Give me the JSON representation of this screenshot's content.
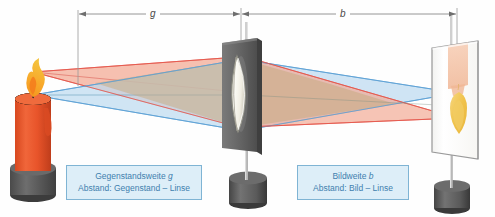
{
  "figure": {
    "background_color": "#fefefe"
  },
  "dimensions": [
    {
      "name": "object-distance",
      "symbol": "g",
      "from_x": 78,
      "to_x": 241,
      "y": 14,
      "label_x": 152,
      "color": "#8a8a8a"
    },
    {
      "name": "image-distance",
      "symbol": "b",
      "from_x": 241,
      "to_x": 457,
      "y": 14,
      "label_x": 342,
      "color": "#8a8a8a"
    }
  ],
  "callouts": [
    {
      "name": "object-distance-callout",
      "line1_prefix": "Gegenstandsweite ",
      "line1_symbol": "g",
      "line2": "Abstand: Gegenstand – Linse",
      "x": 66,
      "y": 165,
      "width": 136,
      "text_color": "#3f7fae",
      "fill_color": "#ddeef8",
      "border_color": "#7fb4d4"
    },
    {
      "name": "image-distance-callout",
      "line1_prefix": "Bildweite ",
      "line1_symbol": "b",
      "line2": "Abstand: Bild – Linse",
      "x": 297,
      "y": 165,
      "width": 112,
      "text_color": "#3f7fae",
      "fill_color": "#ddeef8",
      "border_color": "#7fb4d4"
    }
  ],
  "objects": {
    "candle": {
      "name": "candle-object",
      "body_color": "#e8542a",
      "body_shade": "#c8421f",
      "base_color": "#5a5a5a",
      "flame_outer": "#f5a623",
      "flame_inner": "#f07a1a",
      "wick_color": "#2a2a2a",
      "top_x": 33,
      "top_y": 95,
      "flame_tip_y": 72
    },
    "lens": {
      "name": "converging-lens",
      "center_x": 241,
      "plate_color": "#6d6d6d",
      "plate_edge_color": "#4a4a4a",
      "glass_color": "#f4f1e8",
      "rim_color": "#8b8b80",
      "stand_color": "#5f5f5f"
    },
    "screen": {
      "name": "projection-screen",
      "center_x": 457,
      "surface_color": "#fdfdfd",
      "frame_color": "#9a9a9a",
      "image_flame_color": "#f0c24a",
      "image_body_color": "#f3c0a4",
      "stand_color": "#5f5f5f"
    }
  },
  "rays": {
    "upper_bundle": {
      "name": "flame-tip-ray-bundle",
      "color": "#e4554a",
      "fill": "#f5b0a0",
      "source_x": 33,
      "source_y": 72,
      "focus_x": 457,
      "focus_y": 118
    },
    "lower_bundle": {
      "name": "candle-top-ray-bundle",
      "color": "#5a9fd4",
      "fill": "#b8d8ee",
      "source_x": 33,
      "source_y": 95,
      "focus_x": 457,
      "focus_y": 93
    },
    "overlap_fill": "#c9ad86"
  }
}
